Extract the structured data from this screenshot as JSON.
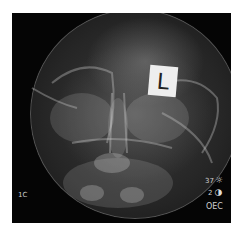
{
  "image": {
    "description": "Frontal skull X-ray radiograph with left-side marker",
    "marker_label": "L",
    "overlays": {
      "left_label": "1C",
      "brightness_value": "37",
      "brightness_icon": "sun-icon",
      "contrast_value": "2",
      "contrast_icon": "half-circle-icon",
      "bottom_right_label": "OEC"
    },
    "colors": {
      "background": "#050505",
      "bone": "#cfcfcf",
      "marker": "#eeeeee"
    }
  }
}
